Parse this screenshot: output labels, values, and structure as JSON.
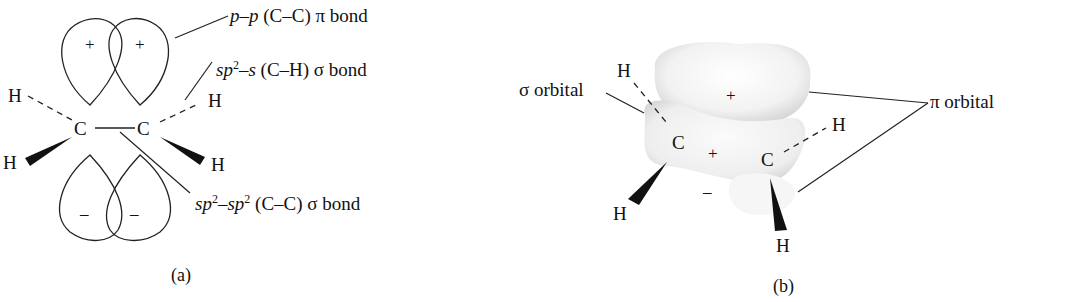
{
  "figure_a": {
    "caption": "(a)",
    "labels": {
      "pi_bond": {
        "pre": "p",
        "dash": "–",
        "post": "p",
        "rest": " (C–C) π bond"
      },
      "ch_sigma": {
        "pre": "sp",
        "sup": "2",
        "mid": "–s",
        "rest": " (C–H) σ bond"
      },
      "cc_sigma": {
        "pre": "sp",
        "sup1": "2",
        "mid": "–sp",
        "sup2": "2",
        "rest": " (C–C) σ bond"
      }
    },
    "atoms": {
      "c1": "C",
      "c2": "C",
      "h1": "H",
      "h2": "H",
      "h3": "H",
      "h4": "H"
    },
    "signs": {
      "top_left": "+",
      "top_right": "+",
      "bottom_left": "–",
      "bottom_right": "–"
    }
  },
  "figure_b": {
    "caption": "(b)",
    "labels": {
      "sigma": "σ orbital",
      "pi": "π orbital"
    },
    "atoms": {
      "c1": "C",
      "c2": "C",
      "h1": "H",
      "h2": "H",
      "h3": "H",
      "h4": "H"
    },
    "signs": {
      "top": "+",
      "middle": "+",
      "bottom": "–"
    }
  }
}
